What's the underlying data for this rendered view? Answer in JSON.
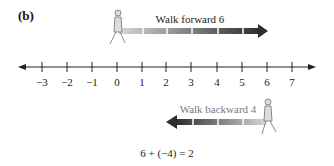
{
  "panel_label": "(b)",
  "forward": {
    "label": "Walk forward 6",
    "start": 0,
    "end": 6
  },
  "backward": {
    "label": "Walk backward 4",
    "start": 6,
    "end": 2
  },
  "number_line": {
    "min": -3,
    "max": 7,
    "ticks": [
      "−3",
      "−2",
      "−1",
      "0",
      "1",
      "2",
      "3",
      "4",
      "5",
      "6",
      "7"
    ]
  },
  "equation": "6 + (−4) = 2",
  "colors": {
    "line": "#222222",
    "arrow_dark": "#333333",
    "arrow_light": "#cccccc",
    "text_gray": "#666666"
  }
}
